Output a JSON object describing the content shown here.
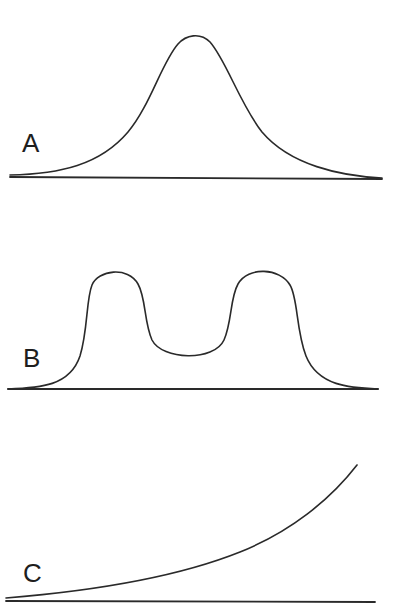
{
  "figure": {
    "type": "distribution-shape-diagram",
    "background_color": "#ffffff",
    "line_color": "#2a2a2a",
    "panels": [
      {
        "label": "A",
        "shape": "unimodal bell-shaped curve",
        "description": "Single symmetric peak centered horizontally"
      },
      {
        "label": "B",
        "shape": "bimodal curve",
        "description": "Two equal peaks separated by a central valley"
      },
      {
        "label": "C",
        "shape": "monotonically increasing (exponential-like) curve",
        "description": "Curve rising slowly from left then steeply to the right"
      }
    ]
  }
}
